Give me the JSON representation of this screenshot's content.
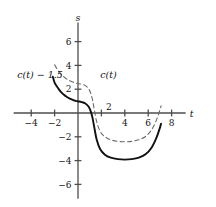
{
  "figure": {
    "axes": {
      "x_name": "t",
      "y_name": "s",
      "x_ticks": [
        "-4",
        "-2",
        "2",
        "4",
        "6",
        "8"
      ],
      "y_ticks": [
        "6",
        "4",
        "2",
        "-2",
        "-4",
        "-6"
      ],
      "inner_tick_label": "2"
    },
    "labels": {
      "dashed_curve": "c(t)",
      "solid_curve": "c(t) - 1.5"
    },
    "colors": {
      "axis": "#4d4d4d",
      "solid_curve": "#111111",
      "dashed_curve": "#6b6b6b",
      "background": "#ffffff"
    }
  },
  "chart_data": {
    "type": "line",
    "title": "",
    "xlabel": "t",
    "ylabel": "s",
    "xlim": [
      -5.5,
      9.2
    ],
    "ylim": [
      -7.2,
      7.6
    ],
    "grid": false,
    "legend": "inline-annotations",
    "xticks": [
      -4,
      -2,
      2,
      4,
      6,
      8
    ],
    "yticks": [
      6,
      4,
      2,
      -2,
      -4,
      -6
    ],
    "annotations": [
      {
        "text": "c(t)",
        "x": 2.6,
        "y": 2.9,
        "style": "dashed-series-label"
      },
      {
        "text": "c(t) - 1.5",
        "x": -5.2,
        "y": 2.9,
        "style": "solid-series-label"
      }
    ],
    "series": [
      {
        "name": "c(t)",
        "style": "dashed",
        "color": "#6b6b6b",
        "x": [
          -2.0,
          -1.8,
          -1.6,
          -1.4,
          -1.2,
          -1.0,
          -0.8,
          -0.6,
          -0.4,
          -0.2,
          0.0,
          0.3,
          0.6,
          0.9,
          1.1,
          1.25,
          1.4,
          1.6,
          1.9,
          2.3,
          2.8,
          3.4,
          4.0,
          4.6,
          5.2,
          5.8,
          6.3,
          6.7,
          7.0,
          7.1
        ],
        "y": [
          4.05,
          3.72,
          3.45,
          3.22,
          3.03,
          2.88,
          2.76,
          2.66,
          2.58,
          2.52,
          2.48,
          2.42,
          2.32,
          2.05,
          1.62,
          1.05,
          0.25,
          -0.75,
          -1.55,
          -2.0,
          -2.25,
          -2.38,
          -2.42,
          -2.38,
          -2.25,
          -1.95,
          -1.4,
          -0.6,
          0.25,
          0.6
        ]
      },
      {
        "name": "c(t) - 1.5",
        "style": "solid",
        "color": "#111111",
        "x": [
          -2.15,
          -2.0,
          -1.8,
          -1.6,
          -1.4,
          -1.2,
          -1.0,
          -0.8,
          -0.6,
          -0.4,
          -0.2,
          0.0,
          0.3,
          0.6,
          0.9,
          1.1,
          1.25,
          1.4,
          1.6,
          1.9,
          2.3,
          2.8,
          3.4,
          4.0,
          4.6,
          5.2,
          5.8,
          6.3,
          6.7,
          7.0,
          7.1
        ],
        "y": [
          3.05,
          2.55,
          2.22,
          1.95,
          1.72,
          1.53,
          1.38,
          1.26,
          1.16,
          1.08,
          1.02,
          0.98,
          0.92,
          0.82,
          0.55,
          0.12,
          -0.45,
          -1.25,
          -2.25,
          -3.05,
          -3.5,
          -3.75,
          -3.88,
          -3.92,
          -3.88,
          -3.75,
          -3.45,
          -2.9,
          -2.1,
          -1.25,
          -0.9
        ]
      }
    ]
  }
}
